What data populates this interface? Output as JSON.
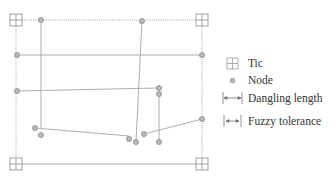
{
  "diagram": {
    "line_color": "#9a9a9a",
    "node_fill": "#b8b8b8",
    "node_stroke": "#888888",
    "tic_stroke": "#8a8a8a",
    "tics": [
      {
        "x": 16,
        "y": 20
      },
      {
        "x": 202,
        "y": 20
      },
      {
        "x": 16,
        "y": 164
      },
      {
        "x": 202,
        "y": 164
      }
    ],
    "dotted_boundary": [
      {
        "x1": 22,
        "y1": 20,
        "x2": 196,
        "y2": 20
      },
      {
        "x1": 16,
        "y1": 26,
        "x2": 16,
        "y2": 158
      },
      {
        "x1": 202,
        "y1": 26,
        "x2": 202,
        "y2": 158
      }
    ],
    "solid_lines": [
      {
        "points": "41,20 41,128"
      },
      {
        "points": "142,21 136,142"
      },
      {
        "points": "17,55 202,55"
      },
      {
        "points": "17,91 159,88"
      },
      {
        "points": "159,94 159,142"
      },
      {
        "points": "35,128 129,136"
      },
      {
        "points": "144,134 202,119"
      },
      {
        "points": "22,164 196,164"
      }
    ],
    "nodes": [
      {
        "x": 41,
        "y": 20
      },
      {
        "x": 142,
        "y": 21
      },
      {
        "x": 17,
        "y": 55
      },
      {
        "x": 202,
        "y": 55
      },
      {
        "x": 17,
        "y": 91
      },
      {
        "x": 159,
        "y": 88
      },
      {
        "x": 159,
        "y": 94
      },
      {
        "x": 35,
        "y": 128
      },
      {
        "x": 41,
        "y": 135
      },
      {
        "x": 129,
        "y": 139
      },
      {
        "x": 136,
        "y": 142
      },
      {
        "x": 144,
        "y": 134
      },
      {
        "x": 159,
        "y": 142
      },
      {
        "x": 202,
        "y": 119
      }
    ]
  },
  "legend": {
    "items": [
      {
        "symbol": "tic-icon",
        "label": "Tic"
      },
      {
        "symbol": "node-icon",
        "label": "Node"
      },
      {
        "symbol": "dangling-length-icon",
        "label": "Dangling length"
      },
      {
        "symbol": "fuzzy-tolerance-icon",
        "label": "Fuzzy tolerance"
      }
    ]
  }
}
